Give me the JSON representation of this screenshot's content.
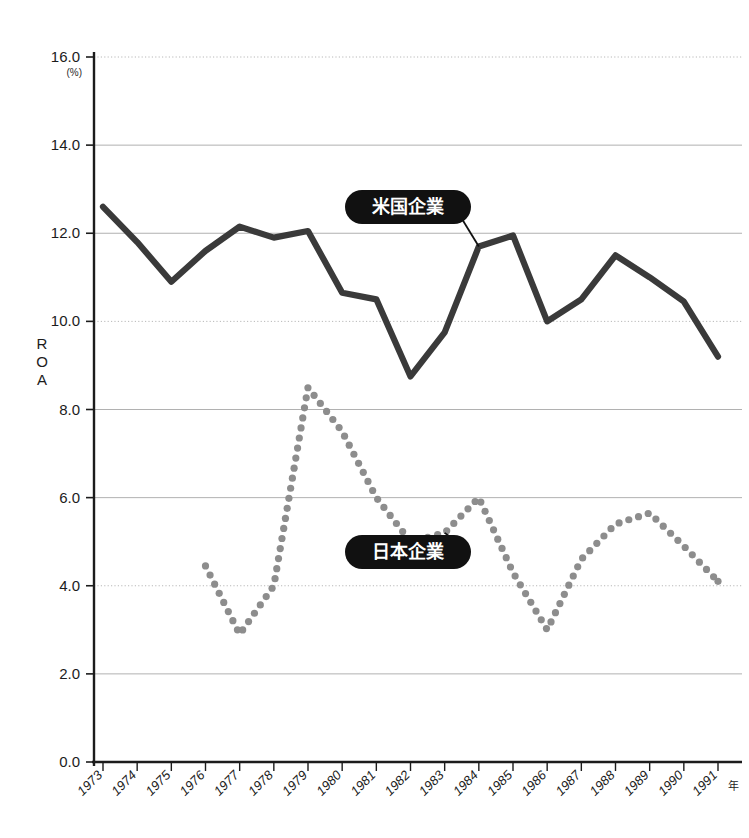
{
  "chart_data": {
    "type": "line",
    "title": "",
    "xlabel": "年",
    "ylabel": "ROA",
    "yunit": "(%)",
    "ylim": [
      0.0,
      16.0
    ],
    "yticks": [
      "0.0",
      "2.0",
      "4.0",
      "6.0",
      "8.0",
      "10.0",
      "12.0",
      "14.0",
      "16.0"
    ],
    "ytick_values": [
      0.0,
      2.0,
      4.0,
      6.0,
      8.0,
      10.0,
      12.0,
      14.0,
      16.0
    ],
    "grid": true,
    "legend_position": "inline-callouts",
    "categories": [
      "1973",
      "1974",
      "1975",
      "1976",
      "1977",
      "1978",
      "1979",
      "1980",
      "1981",
      "1982",
      "1983",
      "1984",
      "1985",
      "1986",
      "1987",
      "1988",
      "1989",
      "1990",
      "1991"
    ],
    "x": [
      1973,
      1974,
      1975,
      1976,
      1977,
      1978,
      1979,
      1980,
      1981,
      1982,
      1983,
      1984,
      1985,
      1986,
      1987,
      1988,
      1989,
      1990,
      1991
    ],
    "series": [
      {
        "name": "米国企業",
        "style": "solid-thick",
        "color": "#3a3a3a",
        "values": [
          12.6,
          11.8,
          10.9,
          11.6,
          12.15,
          11.9,
          12.05,
          10.65,
          10.5,
          8.75,
          9.75,
          11.7,
          11.95,
          10.0,
          10.5,
          11.5,
          11.0,
          10.45,
          9.2
        ]
      },
      {
        "name": "日本企業",
        "style": "dotted",
        "color": "#8d8d8d",
        "values": [
          null,
          null,
          null,
          4.45,
          2.9,
          4.0,
          8.5,
          7.5,
          6.0,
          5.0,
          5.2,
          6.0,
          4.3,
          3.0,
          4.6,
          5.4,
          5.65,
          4.9,
          4.1
        ]
      }
    ],
    "annotations": [
      {
        "label": "米国企業",
        "target_year": 1984,
        "target_value": 11.7
      },
      {
        "label": "日本企業",
        "target_year": 1983,
        "target_value": 5.2
      }
    ]
  },
  "axis": {
    "y_title": "ROA",
    "y_unit": "(%)",
    "x_unit": "年"
  },
  "callouts": {
    "us": "米国企業",
    "jp": "日本企業"
  }
}
